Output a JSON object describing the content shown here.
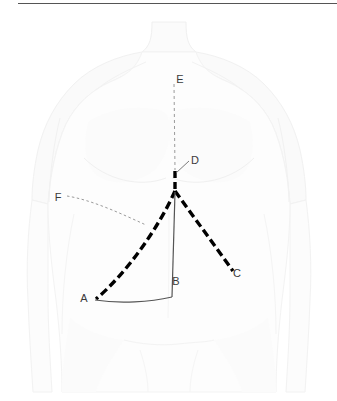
{
  "figure": {
    "background_color": "#ffffff",
    "top_rule_color": "#555555",
    "body_outline_color": "#f2f2f2",
    "body_shade_color": "#f7f7f7",
    "thick_dash_color": "#000000",
    "thin_line_color": "#555555",
    "fine_dash_color": "#9a9a9a",
    "label_color": "#3a3a3a",
    "labels": [
      {
        "id": "A",
        "text": "A",
        "x": 84,
        "y": 302
      },
      {
        "id": "B",
        "text": "B",
        "x": 176,
        "y": 285
      },
      {
        "id": "C",
        "text": "C",
        "x": 234,
        "y": 277
      },
      {
        "id": "D",
        "text": "D",
        "x": 193,
        "y": 163
      },
      {
        "id": "E",
        "text": "E",
        "x": 178,
        "y": 82
      },
      {
        "id": "F",
        "text": "F",
        "x": 58,
        "y": 201
      }
    ],
    "junction_point": {
      "x": 175,
      "y": 191
    },
    "segments": [
      {
        "name": "midline-fine-dashed-E-to-D",
        "style": "fine-dashed",
        "from": "E",
        "to": "D"
      },
      {
        "name": "midline-thick-dashed-D-to-junction",
        "style": "thick-dashed",
        "from": "D",
        "to": "junction"
      },
      {
        "name": "thick-dashed-junction-to-A",
        "style": "thick-dashed-curved",
        "from": "junction",
        "to": "A"
      },
      {
        "name": "thick-dashed-junction-to-C",
        "style": "thick-dashed",
        "from": "junction",
        "to": "C"
      },
      {
        "name": "thin-solid-junction-to-B",
        "style": "thin-solid",
        "from": "junction",
        "to": "B"
      },
      {
        "name": "thin-solid-baseline-A-to-B",
        "style": "thin-solid-curved",
        "from": "A",
        "to": "B"
      },
      {
        "name": "fine-dashed-costal-curve-F",
        "style": "fine-dashed-curved",
        "from": "F",
        "to": "A-line"
      },
      {
        "name": "leader-line-D",
        "style": "thin-solid",
        "from": "D-label",
        "to": "midline"
      }
    ]
  }
}
